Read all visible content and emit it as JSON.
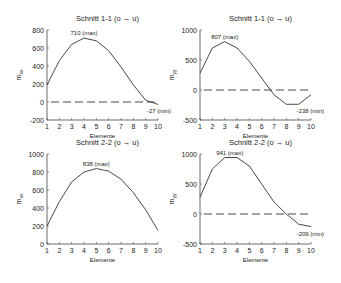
{
  "chart_data": [
    {
      "type": "line",
      "title": "Schnitt  1-1  (o → u)",
      "xlabel": "Elemente",
      "ylabel": "m_xx",
      "x": [
        1,
        2,
        3,
        4,
        5,
        6,
        7,
        8,
        9,
        10
      ],
      "values": [
        190,
        460,
        640,
        710,
        680,
        570,
        390,
        190,
        20,
        -27
      ],
      "ylim": [
        -200,
        800
      ],
      "yticks": [
        -200,
        0,
        200,
        400,
        600,
        800
      ],
      "xticks": [
        1,
        2,
        3,
        4,
        5,
        6,
        7,
        8,
        9,
        10
      ],
      "max_label": "710 (max)",
      "min_label": "-27 (min)",
      "zero_line": true
    },
    {
      "type": "line",
      "title": "Schnitt  1-1  (o → u)",
      "xlabel": "Elemente",
      "ylabel": "m_yy",
      "x": [
        1,
        2,
        3,
        4,
        5,
        6,
        7,
        8,
        9,
        10
      ],
      "values": [
        280,
        700,
        807,
        700,
        480,
        200,
        -80,
        -238,
        -238,
        -80
      ],
      "ylim": [
        -500,
        1000
      ],
      "yticks": [
        -500,
        0,
        500,
        1000
      ],
      "xticks": [
        1,
        2,
        3,
        4,
        5,
        6,
        7,
        8,
        9,
        10
      ],
      "max_label": "807 (max)",
      "min_label": "-238 (min)",
      "zero_line": true
    },
    {
      "type": "line",
      "title": "Schnitt  2-2  (o → u)",
      "xlabel": "Elemente",
      "ylabel": "m_xx",
      "x": [
        1,
        2,
        3,
        4,
        5,
        6,
        7,
        8,
        9,
        10
      ],
      "values": [
        200,
        470,
        690,
        800,
        838,
        810,
        720,
        570,
        380,
        150
      ],
      "ylim": [
        0,
        1000
      ],
      "yticks": [
        0,
        200,
        400,
        600,
        800,
        1000
      ],
      "xticks": [
        1,
        2,
        3,
        4,
        5,
        6,
        7,
        8,
        9,
        10
      ],
      "max_label": "838 (max)",
      "min_label": "",
      "zero_line": false
    },
    {
      "type": "line",
      "title": "Schnitt  2-2  (o → u)",
      "xlabel": "Elemente",
      "ylabel": "m_yy",
      "x": [
        1,
        2,
        3,
        4,
        5,
        6,
        7,
        8,
        9,
        10
      ],
      "values": [
        280,
        750,
        941,
        941,
        800,
        500,
        200,
        0,
        -170,
        -209
      ],
      "ylim": [
        -500,
        1000
      ],
      "yticks": [
        -500,
        0,
        500,
        1000
      ],
      "xticks": [
        1,
        2,
        3,
        4,
        5,
        6,
        7,
        8,
        9,
        10
      ],
      "max_label": "941 (max)",
      "min_label": "-209 (min)",
      "zero_line": true
    }
  ],
  "panels": [
    {
      "x0": 47,
      "x1": 158,
      "yTop": 30,
      "yBot": 120
    },
    {
      "x0": 200,
      "x1": 311,
      "yTop": 30,
      "yBot": 120
    },
    {
      "x0": 47,
      "x1": 158,
      "yTop": 154,
      "yBot": 244
    },
    {
      "x0": 200,
      "x1": 311,
      "yTop": 154,
      "yBot": 244
    }
  ],
  "colors": {
    "line": "#333333",
    "axis": "#444444",
    "text": "#222222"
  }
}
